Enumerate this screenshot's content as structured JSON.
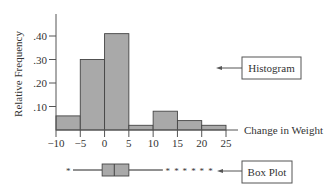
{
  "chart_data": [
    {
      "type": "bar",
      "title": "",
      "xlabel": "Change in Weight",
      "ylabel": "Relative Frequency",
      "bin_edges": [
        -10,
        -5,
        0,
        5,
        10,
        15,
        20,
        25
      ],
      "categories": [
        "-10 to -5",
        "-5 to 0",
        "0 to 5",
        "5 to 10",
        "10 to 15",
        "15 to 20",
        "20 to 25"
      ],
      "values": [
        0.06,
        0.3,
        0.41,
        0.02,
        0.08,
        0.04,
        0.02
      ],
      "x_ticks": [
        "-10",
        "-5",
        "0",
        "5",
        "10",
        "15",
        "20",
        "25"
      ],
      "y_ticks": [
        ".10",
        ".20",
        ".30",
        ".40"
      ],
      "xlim": [
        -10,
        25
      ],
      "ylim": [
        0,
        0.45
      ],
      "grid": false,
      "annotation": "Histogram"
    },
    {
      "type": "box",
      "annotation": "Box Plot",
      "lower_outliers": [
        -7.5
      ],
      "whisker_low": -6.5,
      "q1": -0.5,
      "median": 2,
      "q3": 5,
      "whisker_high": 12,
      "upper_outliers": [
        13,
        14.8,
        16.5,
        18.3,
        20,
        21.8
      ]
    }
  ],
  "labels": {
    "ylabel": "Relative Frequency",
    "xlabel": "Change in Weight",
    "histogram_callout": "Histogram",
    "boxplot_callout": "Box Plot",
    "outlier_marker": "*"
  },
  "colors": {
    "bar_fill": "#a9a9a9",
    "bar_stroke": "#444444",
    "axis": "#555555",
    "text": "#333333"
  }
}
